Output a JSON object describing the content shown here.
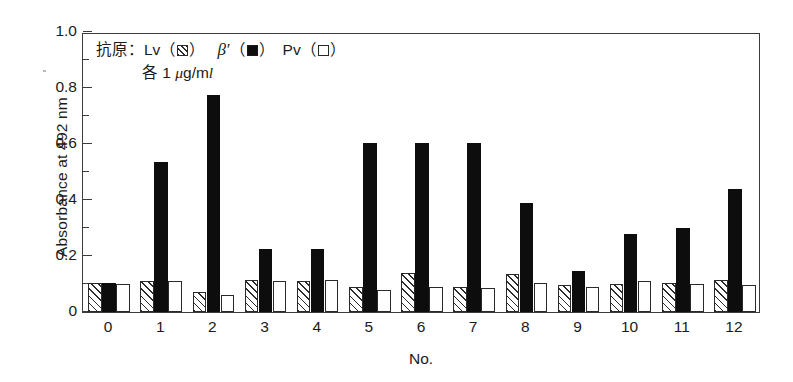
{
  "chart_data": {
    "type": "bar",
    "title": "",
    "subtitle": "",
    "xlabel": "No.",
    "ylabel": "Absorbance at 492 nm",
    "categories": [
      "0",
      "1",
      "2",
      "3",
      "4",
      "5",
      "6",
      "7",
      "8",
      "9",
      "10",
      "11",
      "12"
    ],
    "ylim": [
      0,
      1.0
    ],
    "y_ticks": [
      "0",
      "0.2",
      "0.4",
      "0.6",
      "0.8",
      "1.0"
    ],
    "y_tick_values": [
      0,
      0.2,
      0.4,
      0.6,
      0.8,
      1.0
    ],
    "y_minor_ticks": [
      0.1,
      0.3,
      0.5,
      0.7,
      0.9
    ],
    "grid": false,
    "legend_position": "upper-left-inside",
    "series": [
      {
        "name": "Lv",
        "pattern": "hatched",
        "values": [
          0.105,
          0.11,
          0.07,
          0.115,
          0.11,
          0.09,
          0.14,
          0.09,
          0.135,
          0.095,
          0.1,
          0.105,
          0.115
        ]
      },
      {
        "name": "β′",
        "pattern": "solid-black",
        "values": [
          0.105,
          0.535,
          0.775,
          0.225,
          0.225,
          0.605,
          0.605,
          0.605,
          0.39,
          0.145,
          0.28,
          0.3,
          0.44
        ]
      },
      {
        "name": "Pv",
        "pattern": "open-white",
        "values": [
          0.1,
          0.11,
          0.06,
          0.11,
          0.115,
          0.08,
          0.09,
          0.085,
          0.105,
          0.09,
          0.11,
          0.1,
          0.095
        ]
      }
    ]
  },
  "legend": {
    "line1_prefix": "抗原：",
    "lv_label": "Lv",
    "paren_open": "（",
    "paren_close": "）",
    "beta_label": "β′",
    "pv_label": "Pv",
    "line2_prefix": "各 1 ",
    "line2_mu": "μ",
    "line2_unit_g": "g/m",
    "line2_unit_l": "l"
  },
  "axes": {
    "y_title": "Absorbance at 492 nm",
    "x_title": "No."
  }
}
